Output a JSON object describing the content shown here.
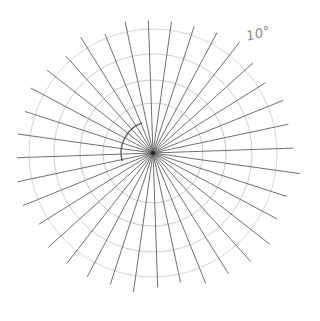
{
  "diagram": {
    "type": "polar-grid-sketch",
    "angle_label": "10°",
    "center": [
      153,
      153
    ],
    "ray_count": 36,
    "ray_step_deg": 10,
    "ray_lengths": [
      140,
      138,
      140,
      132,
      134,
      140,
      136,
      133,
      132,
      132,
      134,
      128,
      136,
      130,
      134,
      138,
      134,
      136,
      136,
      138,
      140,
      134,
      140,
      140,
      140,
      138,
      140,
      134,
      132,
      140,
      142,
      146,
      148,
      140,
      140,
      148
    ],
    "circles": [
      {
        "r": 32,
        "partial": true,
        "start_deg": 165,
        "end_deg": 250,
        "color": "#555555",
        "width": 1.3
      },
      {
        "r": 50,
        "partial": false,
        "color": "#c8c8c8",
        "width": 1.0
      },
      {
        "r": 73,
        "partial": false,
        "color": "#c8c8c8",
        "width": 1.0
      },
      {
        "r": 99,
        "partial": false,
        "color": "#cfcfcf",
        "width": 1.0
      },
      {
        "r": 124,
        "partial": false,
        "color": "#d4d4d4",
        "width": 1.0
      }
    ],
    "colors": {
      "ray": "#5e5e5e",
      "center_dot": "#222222",
      "background": "#ffffff"
    }
  }
}
